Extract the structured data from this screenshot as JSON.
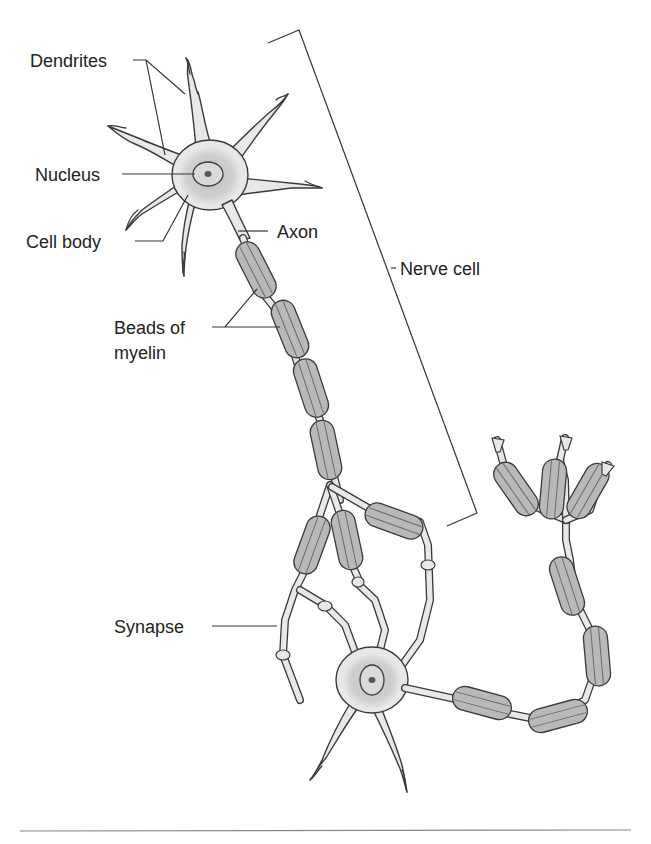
{
  "figure": {
    "labels": {
      "dendrites": "Dendrites",
      "nucleus": "Nucleus",
      "cell_body": "Cell body",
      "axon": "Axon",
      "nerve_cell": "Nerve cell",
      "beads_line1": "Beads of",
      "beads_line2": "myelin",
      "synapse": "Synapse"
    },
    "colors": {
      "cell_fill": "#e8e8e8",
      "cell_glow": "#c4c4c4",
      "myelin_fill": "#b9b9b9",
      "outline": "#3a3a3a",
      "text": "#222222"
    }
  }
}
